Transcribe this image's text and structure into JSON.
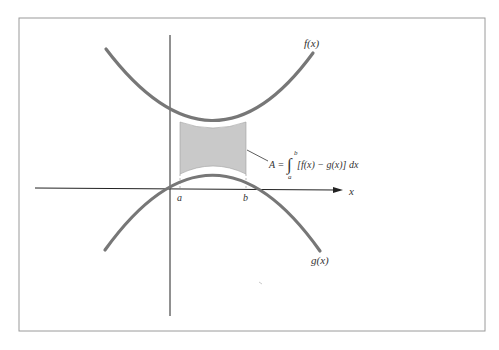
{
  "diagram": {
    "curves": [
      {
        "name": "f(x)",
        "label": "f(x)",
        "shape": "upward parabola",
        "color": "#7a7a7a"
      },
      {
        "name": "g(x)",
        "label": "g(x)",
        "shape": "downward parabola",
        "color": "#7a7a7a"
      }
    ],
    "axes": {
      "x_label": "x"
    },
    "bounds": {
      "a_label": "a",
      "b_label": "b"
    },
    "shaded_region": {
      "color": "#c8c8c8",
      "between": [
        "f(x)",
        "g(x)"
      ],
      "from": "a",
      "to": "b"
    },
    "formula": {
      "lhs": "A =",
      "integral_sign": "∫",
      "upper_limit": "b",
      "lower_limit": "a",
      "integrand": "[f(x) − g(x)] dx"
    }
  }
}
